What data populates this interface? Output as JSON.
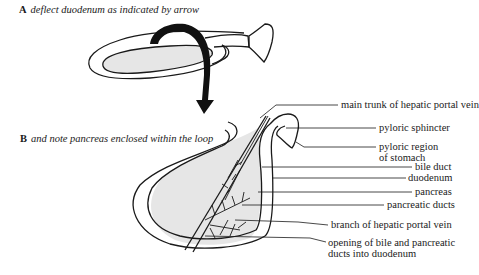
{
  "captions": {
    "a": {
      "letter": "A",
      "text": "deflect duodenum as indicated by arrow"
    },
    "b": {
      "letter": "B",
      "text": "and note pancreas enclosed within the loop"
    }
  },
  "labels": [
    {
      "id": "main-trunk-hepatic-portal-vein",
      "lines": [
        "main trunk of hepatic portal vein"
      ]
    },
    {
      "id": "pyloric-sphincter",
      "lines": [
        "pyloric sphincter"
      ]
    },
    {
      "id": "pyloric-region",
      "lines": [
        "pyloric region",
        "of stomach"
      ]
    },
    {
      "id": "bile-duct",
      "lines": [
        "bile duct"
      ]
    },
    {
      "id": "duodenum",
      "lines": [
        "duodenum"
      ]
    },
    {
      "id": "pancreas",
      "lines": [
        "pancreas"
      ]
    },
    {
      "id": "pancreatic-ducts",
      "lines": [
        "pancreatic ducts"
      ]
    },
    {
      "id": "branch-hepatic-portal-vein",
      "lines": [
        "branch of hepatic portal vein"
      ]
    },
    {
      "id": "opening-ducts",
      "lines": [
        "opening of bile and pancreatic",
        "ducts into duodenum"
      ]
    }
  ],
  "colors": {
    "line": "#1a1a1a",
    "pancreas_fill": "#e6e6e6",
    "background": "#ffffff"
  }
}
